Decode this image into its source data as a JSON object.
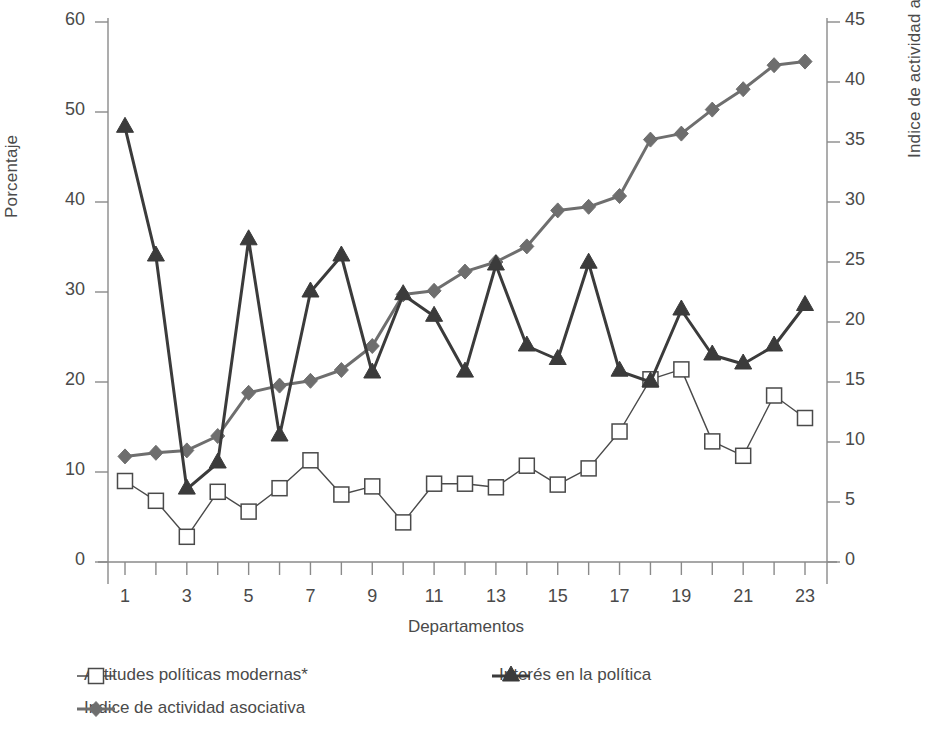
{
  "chart_data": {
    "type": "line",
    "title": "",
    "xlabel": "Departamentos",
    "ylabel": "Porcentaje",
    "ylabel_right": "Indice de actividad asociativa",
    "x": [
      1,
      2,
      3,
      4,
      5,
      6,
      7,
      8,
      9,
      10,
      11,
      12,
      13,
      14,
      15,
      16,
      17,
      18,
      19,
      20,
      21,
      22,
      23
    ],
    "xtick_labels": [
      "1",
      "3",
      "5",
      "7",
      "9",
      "11",
      "13",
      "15",
      "17",
      "19",
      "21",
      "23"
    ],
    "xtick_values": [
      1,
      3,
      5,
      7,
      9,
      11,
      13,
      15,
      17,
      19,
      21,
      23
    ],
    "ylim": [
      0,
      60
    ],
    "ytick_labels": [
      "0",
      "10",
      "20",
      "30",
      "40",
      "50",
      "60"
    ],
    "ytick_values": [
      0,
      10,
      20,
      30,
      40,
      50,
      60
    ],
    "ylim_right": [
      0,
      45
    ],
    "ytick_labels_right": [
      "0",
      "5",
      "10",
      "15",
      "20",
      "25",
      "30",
      "35",
      "40",
      "45"
    ],
    "ytick_values_right": [
      0,
      5,
      10,
      15,
      20,
      25,
      30,
      35,
      40,
      45
    ],
    "grid": false,
    "legend_position": "below",
    "series": [
      {
        "name": "Actitudes políticas modernas*",
        "marker": "open-square",
        "axis": "left",
        "color": "#4a4a4a",
        "values": [
          9.0,
          6.8,
          2.8,
          7.8,
          5.6,
          8.2,
          11.3,
          7.5,
          8.4,
          4.4,
          8.7,
          8.7,
          8.3,
          10.7,
          8.6,
          10.4,
          14.5,
          20.3,
          21.4,
          13.4,
          11.8,
          18.5,
          16.0
        ]
      },
      {
        "name": "Interés en la política",
        "marker": "filled-triangle",
        "axis": "left",
        "color": "#3b3b3b",
        "values": [
          48.3,
          34.0,
          8.1,
          11.0,
          35.8,
          14.0,
          30.0,
          34.0,
          21.0,
          29.7,
          27.3,
          21.1,
          33.0,
          24.0,
          22.5,
          33.2,
          21.2,
          20.0,
          28.0,
          23.0,
          22.0,
          24.0,
          28.5
        ]
      },
      {
        "name": "Indice de actividad asociativa",
        "marker": "filled-diamond",
        "axis": "right",
        "color": "#6e6e6e",
        "values": [
          8.8,
          9.1,
          9.3,
          10.5,
          14.1,
          14.7,
          15.1,
          16.0,
          18.0,
          22.3,
          22.6,
          24.2,
          25.0,
          26.3,
          29.3,
          29.6,
          30.5,
          35.2,
          35.7,
          37.7,
          39.4,
          41.4,
          41.7
        ]
      }
    ]
  },
  "legend": {
    "items": [
      {
        "label": "Actitudes políticas modernas*",
        "marker": "open-square",
        "color": "#4a4a4a"
      },
      {
        "label": "Interés en la política",
        "marker": "filled-triangle",
        "color": "#3b3b3b"
      },
      {
        "label": "Indice de actividad asociativa",
        "marker": "filled-diamond",
        "color": "#6e6e6e"
      }
    ]
  }
}
